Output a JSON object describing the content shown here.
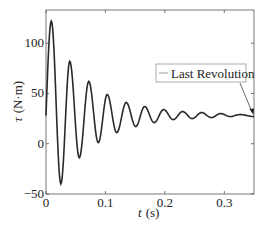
{
  "chart_data": {
    "type": "line",
    "title": "",
    "xlabel": "t (s)",
    "xlabel_var": "t",
    "xlabel_unit": "(s)",
    "ylabel": "τ (N·m)",
    "ylabel_var": "τ",
    "ylabel_unit": "(N·m)",
    "xlim": [
      0,
      0.35
    ],
    "ylim": [
      -50,
      133
    ],
    "xticks": [
      0,
      0.1,
      0.2,
      0.3
    ],
    "xtick_labels": [
      "0",
      "0.1",
      "0.2",
      "0.3"
    ],
    "yticks": [
      -50,
      0,
      50,
      100
    ],
    "ytick_labels": [
      "−50",
      "0",
      "50",
      "100"
    ],
    "grid": false,
    "legend": {
      "entries": [
        "Last Revolution"
      ],
      "position": "center-right"
    },
    "annotation": {
      "type": "arrow",
      "from_legend_to": [
        0.35,
        28
      ]
    },
    "series": [
      {
        "name": "Last Revolution",
        "model": "damped sinusoid",
        "offset": 28,
        "initial_amplitude": 94,
        "period_s": 0.032,
        "peaks": [
          {
            "t": 0.009,
            "y": 122
          },
          {
            "t": 0.04,
            "y": 82
          },
          {
            "t": 0.072,
            "y": 62
          },
          {
            "t": 0.103,
            "y": 49
          },
          {
            "t": 0.135,
            "y": 41
          },
          {
            "t": 0.166,
            "y": 37
          },
          {
            "t": 0.198,
            "y": 34
          },
          {
            "t": 0.23,
            "y": 32
          },
          {
            "t": 0.262,
            "y": 31
          },
          {
            "t": 0.294,
            "y": 30
          },
          {
            "t": 0.326,
            "y": 29
          }
        ],
        "troughs": [
          {
            "t": 0.025,
            "y": -40
          },
          {
            "t": 0.056,
            "y": -14
          },
          {
            "t": 0.088,
            "y": 1
          },
          {
            "t": 0.119,
            "y": 11
          },
          {
            "t": 0.151,
            "y": 17
          },
          {
            "t": 0.182,
            "y": 21
          },
          {
            "t": 0.214,
            "y": 24
          },
          {
            "t": 0.246,
            "y": 25
          },
          {
            "t": 0.278,
            "y": 26
          },
          {
            "t": 0.31,
            "y": 27
          }
        ],
        "final_value": 27
      }
    ]
  }
}
